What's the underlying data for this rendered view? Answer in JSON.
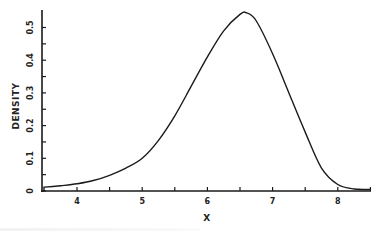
{
  "chart_data": {
    "type": "line",
    "title": "",
    "xlabel": "X",
    "ylabel": "DENSITY",
    "xlim": [
      3.45,
      8.5
    ],
    "ylim": [
      0,
      0.55
    ],
    "grid": false,
    "legend": null,
    "x_ticks_major": [
      4,
      5,
      6,
      7,
      8
    ],
    "x_ticks_minor": [
      4.5,
      5.5,
      6.5,
      7.5,
      8.5
    ],
    "y_ticks_major": [
      0,
      0.1,
      0.2,
      0.3,
      0.4,
      0.5
    ],
    "y_ticks_minor": [
      0.05,
      0.15,
      0.25,
      0.35,
      0.45
    ],
    "x_tick_labels": [
      "4",
      "5",
      "6",
      "7",
      "8"
    ],
    "y_tick_labels": [
      "0",
      "0.1",
      "0.2",
      "0.3",
      "0.4",
      "0.5"
    ],
    "series": [
      {
        "name": "density",
        "x": [
          3.5,
          3.75,
          4.0,
          4.25,
          4.5,
          4.75,
          5.0,
          5.25,
          5.5,
          5.75,
          6.0,
          6.25,
          6.5,
          6.6,
          6.75,
          7.0,
          7.25,
          7.5,
          7.75,
          8.0,
          8.25,
          8.5
        ],
        "y": [
          0.012,
          0.016,
          0.022,
          0.032,
          0.048,
          0.07,
          0.1,
          0.155,
          0.23,
          0.32,
          0.41,
          0.49,
          0.54,
          0.545,
          0.52,
          0.42,
          0.3,
          0.18,
          0.07,
          0.02,
          0.006,
          0.005
        ]
      }
    ]
  },
  "style": {
    "line_color": "#1a1a1a",
    "axis_color": "#1a1a1a",
    "background": "#ffffff"
  }
}
